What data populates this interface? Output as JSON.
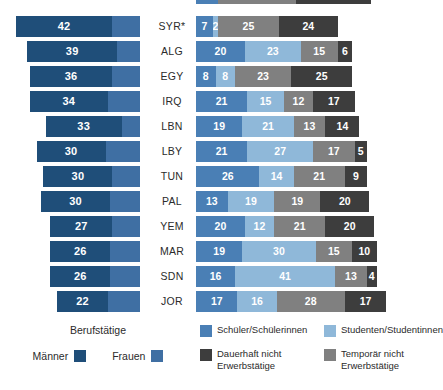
{
  "colors": {
    "maenner": "#1f4e79",
    "frauen": "#3f6fa3",
    "schueler": "#4a7fb5",
    "studenten": "#8fb8d9",
    "dauerhaft_nicht": "#3d3d3d",
    "temporaer_nicht": "#808080",
    "background": "#ffffff",
    "text": "#2b2b2b",
    "value_text": "#ffffff"
  },
  "legend": {
    "left_title": "Berufstätige",
    "maenner_label": "Männer",
    "frauen_label": "Frauen",
    "schueler_label": "Schüler/Schülerinnen",
    "studenten_label": "Studenten/Studentinnen",
    "dauerhaft_label": "Dauerhaft nicht\nErwerbstätige",
    "temporaer_label": "Temporär nicht\nErwerbstätige"
  },
  "chart_data": {
    "type": "bar",
    "title": "",
    "subtitle": "",
    "xlabel": "",
    "ylabel": "",
    "grid": false,
    "legend_position": "bottom",
    "categories": [
      "SYR*",
      "ALG",
      "EGY",
      "IRQ",
      "LBN",
      "LBY",
      "TUN",
      "PAL",
      "YEM",
      "MAR",
      "SDN",
      "JOR"
    ],
    "left_panel": {
      "note": "Berufstätige (employed) split by gender; bars right-aligned to a common edge",
      "series": [
        {
          "name": "Männer",
          "color": "#1f4e79",
          "values": [
            42,
            39,
            36,
            34,
            33,
            30,
            30,
            30,
            27,
            26,
            26,
            22
          ]
        },
        {
          "name": "Frauen",
          "color": "#3f6fa3",
          "values": [
            12,
            10,
            12,
            14,
            8,
            15,
            12,
            13,
            12,
            13,
            13,
            14
          ]
        }
      ]
    },
    "right_panel": {
      "note": "Stacked 100%-style composition of non-employed categories",
      "series": [
        {
          "name": "Schüler/Schülerinnen",
          "color": "#4a7fb5",
          "values": [
            7,
            20,
            8,
            21,
            19,
            21,
            26,
            13,
            20,
            19,
            16,
            17
          ]
        },
        {
          "name": "Studenten/Studentinnen",
          "color": "#8fb8d9",
          "values": [
            2,
            23,
            8,
            15,
            21,
            27,
            14,
            19,
            12,
            30,
            41,
            16
          ]
        },
        {
          "name": "Temporär nicht Erwerbstätige",
          "color": "#808080",
          "values": [
            25,
            15,
            23,
            12,
            13,
            17,
            21,
            19,
            21,
            15,
            13,
            28
          ]
        },
        {
          "name": "Dauerhaft nicht Erwerbstätige",
          "color": "#3d3d3d",
          "values": [
            24,
            6,
            25,
            17,
            14,
            5,
            9,
            20,
            20,
            10,
            4,
            17
          ]
        }
      ]
    },
    "rows": [
      {
        "country": "SYR*",
        "maenner": 42,
        "frauen": 12,
        "schueler": 7,
        "studenten": 2,
        "temporaer": 25,
        "dauerhaft": 24
      },
      {
        "country": "ALG",
        "maenner": 39,
        "frauen": 10,
        "schueler": 20,
        "studenten": 23,
        "temporaer": 15,
        "dauerhaft": 6
      },
      {
        "country": "EGY",
        "maenner": 36,
        "frauen": 12,
        "schueler": 8,
        "studenten": 8,
        "temporaer": 23,
        "dauerhaft": 25
      },
      {
        "country": "IRQ",
        "maenner": 34,
        "frauen": 14,
        "schueler": 21,
        "studenten": 15,
        "temporaer": 12,
        "dauerhaft": 17
      },
      {
        "country": "LBN",
        "maenner": 33,
        "frauen": 8,
        "schueler": 19,
        "studenten": 21,
        "temporaer": 13,
        "dauerhaft": 14
      },
      {
        "country": "LBY",
        "maenner": 30,
        "frauen": 15,
        "schueler": 21,
        "studenten": 27,
        "temporaer": 17,
        "dauerhaft": 5
      },
      {
        "country": "TUN",
        "maenner": 30,
        "frauen": 12,
        "schueler": 26,
        "studenten": 14,
        "temporaer": 21,
        "dauerhaft": 9
      },
      {
        "country": "PAL",
        "maenner": 30,
        "frauen": 13,
        "schueler": 13,
        "studenten": 19,
        "temporaer": 19,
        "dauerhaft": 20
      },
      {
        "country": "YEM",
        "maenner": 27,
        "frauen": 12,
        "schueler": 20,
        "studenten": 12,
        "temporaer": 21,
        "dauerhaft": 20
      },
      {
        "country": "MAR",
        "maenner": 26,
        "frauen": 13,
        "schueler": 19,
        "studenten": 30,
        "temporaer": 15,
        "dauerhaft": 10
      },
      {
        "country": "SDN",
        "maenner": 26,
        "frauen": 13,
        "schueler": 16,
        "studenten": 41,
        "temporaer": 13,
        "dauerhaft": 4
      },
      {
        "country": "JOR",
        "maenner": 22,
        "frauen": 14,
        "schueler": 17,
        "studenten": 16,
        "temporaer": 28,
        "dauerhaft": 17
      }
    ]
  }
}
